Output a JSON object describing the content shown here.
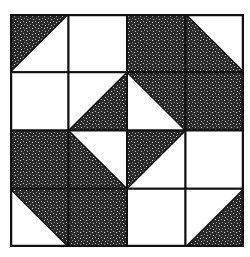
{
  "diagram": {
    "type": "quilt-block",
    "grid": {
      "rows": 4,
      "cols": 4
    },
    "colors": {
      "dark": "#2a2a2a",
      "light": "#ffffff",
      "line": "#111111"
    },
    "cells": [
      [
        {
          "shade": "tl",
          "diag": "/"
        },
        {
          "shade": "none"
        },
        {
          "shade": "full"
        },
        {
          "shade": "bl",
          "diag": "\\"
        }
      ],
      [
        {
          "shade": "none"
        },
        {
          "shade": "br",
          "diag": "/"
        },
        {
          "shade": "tr",
          "diag": "\\"
        },
        {
          "shade": "full"
        }
      ],
      [
        {
          "shade": "full"
        },
        {
          "shade": "bl",
          "diag": "\\"
        },
        {
          "shade": "tl",
          "diag": "/"
        },
        {
          "shade": "none"
        }
      ],
      [
        {
          "shade": "tr",
          "diag": "\\"
        },
        {
          "shade": "full"
        },
        {
          "shade": "none"
        },
        {
          "shade": "br",
          "diag": "/"
        }
      ]
    ]
  }
}
